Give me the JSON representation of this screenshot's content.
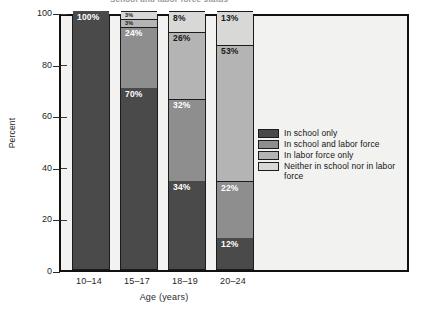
{
  "chart_data": {
    "type": "bar",
    "subtype": "stacked-bar-percent",
    "title": "School and labor force status",
    "xlabel": "Age (years)",
    "ylabel": "Percent",
    "ylim": [
      0,
      100
    ],
    "yticks": [
      0,
      20,
      40,
      60,
      80,
      100
    ],
    "ytick_labels": [
      "0",
      "20",
      "40",
      "60",
      "80",
      "100"
    ],
    "grid": false,
    "legend_position": "right",
    "categories": [
      "10–14",
      "15–17",
      "18–19",
      "20–24"
    ],
    "series": [
      {
        "name": "In school only",
        "color": "#4a4a4a",
        "label_color": "#ffffff",
        "values": [
          100,
          70,
          34,
          12
        ],
        "value_labels": [
          "100%",
          "70%",
          "34%",
          "12%"
        ]
      },
      {
        "name": "In school and labor force",
        "color": "#8e8e8e",
        "label_color": "#ffffff",
        "values": [
          0,
          24,
          32,
          22
        ],
        "value_labels": [
          "",
          "24%",
          "32%",
          "22%"
        ]
      },
      {
        "name": "In labor force only",
        "color": "#b4b4b4",
        "label_color": "#1a1a1a",
        "values": [
          0,
          3,
          26,
          53
        ],
        "value_labels": [
          "",
          "3%",
          "26%",
          "53%"
        ]
      },
      {
        "name": "Neither in school nor in labor force",
        "color": "#d8d8d6",
        "label_color": "#1a1a1a",
        "values": [
          0,
          3,
          8,
          13
        ],
        "value_labels": [
          "",
          "3%",
          "8%",
          "13%"
        ]
      }
    ]
  },
  "legend": {
    "items": [
      {
        "label": "In school only",
        "color": "#4a4a4a"
      },
      {
        "label": "In school and labor force",
        "color": "#8e8e8e"
      },
      {
        "label": "In labor force only",
        "color": "#b4b4b4"
      },
      {
        "label": "Neither in school nor in labor force",
        "color": "#d8d8d6"
      }
    ]
  },
  "colors": {
    "plot_background": "#f2f2f0",
    "frame": "#111111",
    "page_background": "#ffffff"
  }
}
